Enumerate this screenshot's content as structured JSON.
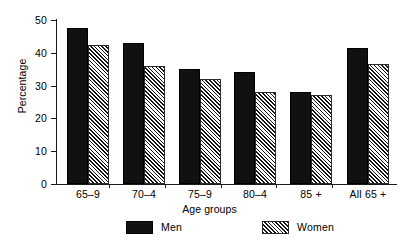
{
  "chart_data": {
    "type": "bar",
    "title": "",
    "xlabel": "Age groups",
    "ylabel": "Percentage",
    "categories": [
      "65–9",
      "70–4",
      "75–9",
      "80–4",
      "85 +",
      "All 65 +"
    ],
    "series": [
      {
        "name": "Men",
        "values": [
          47.5,
          43,
          35,
          34,
          28,
          41.5
        ]
      },
      {
        "name": "Women",
        "values": [
          42.5,
          36,
          32,
          28,
          27,
          36.5
        ]
      }
    ],
    "ylim": [
      0,
      50
    ],
    "yticks": [
      0,
      10,
      20,
      30,
      40,
      50
    ],
    "ytick_labels": [
      "0",
      "10",
      "20",
      "30",
      "40",
      "50"
    ],
    "grid": false,
    "legend_position": "bottom",
    "legend_entries": [
      "Men",
      "Women"
    ]
  },
  "axes": {
    "y_title": "Percentage",
    "x_title": "Age groups",
    "y_ticks": [
      {
        "value": 50,
        "label": "50"
      },
      {
        "value": 40,
        "label": "40"
      },
      {
        "value": 30,
        "label": "30"
      },
      {
        "value": 20,
        "label": "20"
      },
      {
        "value": 10,
        "label": "10"
      },
      {
        "value": 0,
        "label": "0"
      }
    ]
  },
  "groups": [
    {
      "label": "65–9",
      "men": 47.5,
      "women": 42.5
    },
    {
      "label": "70–4",
      "men": 43,
      "women": 36
    },
    {
      "label": "75–9",
      "men": 35,
      "women": 32
    },
    {
      "label": "80–4",
      "men": 34,
      "women": 28
    },
    {
      "label": "85 +",
      "men": 28,
      "women": 27
    },
    {
      "label": "All 65 +",
      "men": 41.5,
      "women": 36.5
    }
  ],
  "legend": {
    "men_label": "Men",
    "women_label": "Women"
  },
  "colors": {
    "men_fill": "#111111",
    "women_hatch": "#141414",
    "axis": "#1a1a1a",
    "background": "#ffffff"
  }
}
